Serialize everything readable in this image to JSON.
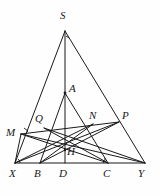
{
  "figure": {
    "background_color": "#fefefe",
    "stroke_color": "#1a1a1c",
    "label_color": "#17171a",
    "stroke_width": 1.0,
    "width": 160,
    "height": 196
  },
  "points": [
    {
      "id": "S",
      "label": "S",
      "x": 65,
      "y": 31,
      "label_x": 60,
      "label_y": 10,
      "role": "apex-vertex"
    },
    {
      "id": "A",
      "label": "A",
      "x": 65,
      "y": 93,
      "label_x": 69,
      "label_y": 83,
      "role": "interior-vertex"
    },
    {
      "id": "P",
      "label": "P",
      "x": 119,
      "y": 122,
      "label_x": 122,
      "label_y": 110,
      "role": "intersection"
    },
    {
      "id": "N",
      "label": "N",
      "x": 93,
      "y": 124,
      "label_x": 89,
      "label_y": 110,
      "role": "intersection"
    },
    {
      "id": "Q",
      "label": "Q",
      "x": 44,
      "y": 128,
      "label_x": 35,
      "label_y": 113,
      "role": "intersection"
    },
    {
      "id": "M",
      "label": "M",
      "x": 21,
      "y": 134,
      "label_x": 6,
      "label_y": 127,
      "role": "foot-point"
    },
    {
      "id": "H",
      "label": "H",
      "x": 65,
      "y": 150,
      "label_x": 67,
      "label_y": 146,
      "role": "orthocenter"
    },
    {
      "id": "X",
      "label": "X",
      "x": 15,
      "y": 163,
      "label_x": 9,
      "label_y": 168,
      "role": "base-vertex"
    },
    {
      "id": "B",
      "label": "B",
      "x": 40,
      "y": 163,
      "label_x": 34,
      "label_y": 168,
      "role": "base-point"
    },
    {
      "id": "D",
      "label": "D",
      "x": 65,
      "y": 163,
      "label_x": 59,
      "label_y": 168,
      "role": "base-point"
    },
    {
      "id": "C",
      "label": "C",
      "x": 108,
      "y": 163,
      "label_x": 103,
      "label_y": 168,
      "role": "base-point"
    },
    {
      "id": "Y",
      "label": "Y",
      "x": 145,
      "y": 163,
      "label_x": 138,
      "label_y": 168,
      "role": "base-vertex"
    }
  ],
  "segments": [
    {
      "name": "SX",
      "from": "S",
      "to": "X"
    },
    {
      "name": "SY",
      "from": "S",
      "to": "Y"
    },
    {
      "name": "XY",
      "from": "X",
      "to": "Y"
    },
    {
      "name": "SD",
      "from": "S",
      "to": "D"
    },
    {
      "name": "AB",
      "from": "A",
      "to": "B"
    },
    {
      "name": "AC",
      "from": "A",
      "to": "C"
    },
    {
      "name": "AD",
      "from": "A",
      "to": "D"
    },
    {
      "name": "XP",
      "from": "X",
      "to": "P"
    },
    {
      "name": "MP",
      "from": "M",
      "to": "P"
    },
    {
      "name": "MC",
      "from": "M",
      "to": "C"
    },
    {
      "name": "BP",
      "from": "B",
      "to": "P"
    },
    {
      "name": "XN",
      "from": "X",
      "to": "N"
    },
    {
      "name": "CQ",
      "from": "C",
      "to": "Q"
    },
    {
      "name": "BN",
      "from": "B",
      "to": "N"
    },
    {
      "name": "QY",
      "from": "Q",
      "to": "Y"
    },
    {
      "name": "MY",
      "from": "M",
      "to": "Y"
    },
    {
      "name": "XM",
      "from": "X",
      "to": "M"
    },
    {
      "name": "CY",
      "from": "C",
      "to": "Y"
    }
  ],
  "angle_marks": [
    {
      "name": "right-angle-at-M",
      "type": "right-angle",
      "x": 23,
      "y": 131
    },
    {
      "name": "angle-arc-at-X",
      "type": "arc",
      "x": 15,
      "y": 163
    },
    {
      "name": "angle-arc-at-C",
      "type": "arc",
      "x": 108,
      "y": 163
    },
    {
      "name": "tick-at-S",
      "type": "tick",
      "x": 67,
      "y": 36
    }
  ]
}
